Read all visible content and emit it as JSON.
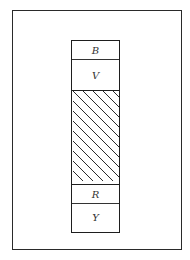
{
  "diagram": {
    "type": "stacked-column-in-frame",
    "frame": {
      "stroke": "#2a2a2a"
    },
    "column": {
      "bands": [
        {
          "id": "b",
          "label": "B",
          "fill": "none"
        },
        {
          "id": "v",
          "label": "V",
          "fill": "none"
        },
        {
          "id": "hatch",
          "label": "",
          "fill": "diagonal-hatch"
        },
        {
          "id": "r",
          "label": "R",
          "fill": "none"
        },
        {
          "id": "y",
          "label": "Y",
          "fill": "none"
        }
      ]
    },
    "colors": {
      "stroke": "#1e1e1e",
      "label": "#333333",
      "background": "#ffffff"
    }
  }
}
